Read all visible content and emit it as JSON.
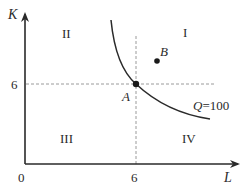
{
  "diagram": {
    "axes": {
      "y_label": "K",
      "x_label": "L",
      "origin_label": "0",
      "y_tick_label": "6",
      "x_tick_label": "6"
    },
    "regions": {
      "top_left": "II",
      "top_right": "I",
      "bottom_left": "III",
      "bottom_right": "IV"
    },
    "points": {
      "a_label": "A",
      "b_label": "B"
    },
    "curve": {
      "q_symbol": "Q",
      "q_value": "=100"
    },
    "colors": {
      "line": "#2a2a2a",
      "guide": "#9a9a9a",
      "background": "#ffffff"
    }
  }
}
